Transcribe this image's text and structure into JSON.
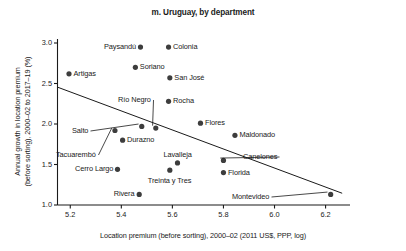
{
  "chart_data": {
    "type": "scatter",
    "title": "m. Uruguay, by department",
    "xlabel": "Location premium (before sorting), 2000–02 (2011 US$, PPP, log)",
    "ylabel_line1": "Annual growth in location premium",
    "ylabel_line2": "(before sorting), 2000–02 to 2017–19 (%)",
    "xlim": [
      5.15,
      6.28
    ],
    "ylim": [
      1.0,
      3.0
    ],
    "xticks": [
      "5.2",
      "5.4",
      "5.6",
      "5.8",
      "6.0",
      "6.2"
    ],
    "xtick_values": [
      5.2,
      5.4,
      5.6,
      5.8,
      6.0,
      6.2
    ],
    "yticks": [
      "1.0",
      "1.5",
      "2.0",
      "2.5",
      "3.0"
    ],
    "ytick_values": [
      1.0,
      1.5,
      2.0,
      2.5,
      3.0
    ],
    "grid": false,
    "legend": "none",
    "points": [
      {
        "name": "Paysandú",
        "x": 5.475,
        "y": 2.95,
        "label_side": "left"
      },
      {
        "name": "Colonia",
        "x": 5.585,
        "y": 2.95,
        "label_side": "right"
      },
      {
        "name": "Soriano",
        "x": 5.455,
        "y": 2.7,
        "label_side": "right"
      },
      {
        "name": "Artigas",
        "x": 5.195,
        "y": 2.62,
        "label_side": "right"
      },
      {
        "name": "San José",
        "x": 5.59,
        "y": 2.57,
        "label_side": "right"
      },
      {
        "name": "Rocha",
        "x": 5.585,
        "y": 2.28,
        "label_side": "right"
      },
      {
        "name": "Río Negro",
        "x": 5.535,
        "y": 1.95,
        "label_side": "leader"
      },
      {
        "name": "Flores",
        "x": 5.71,
        "y": 2.01,
        "label_side": "right"
      },
      {
        "name": "Salto",
        "x": 5.48,
        "y": 1.97,
        "label_side": "leader"
      },
      {
        "name": "Tacuarembó",
        "x": 5.375,
        "y": 1.92,
        "label_side": "leader"
      },
      {
        "name": "Maldonado",
        "x": 5.845,
        "y": 1.86,
        "label_side": "right"
      },
      {
        "name": "Durazno",
        "x": 5.405,
        "y": 1.8,
        "label_side": "right"
      },
      {
        "name": "Canelones",
        "x": 5.8,
        "y": 1.55,
        "label_side": "leader"
      },
      {
        "name": "Lavalleja",
        "x": 5.62,
        "y": 1.52,
        "label_side": "above"
      },
      {
        "name": "Cerro Largo",
        "x": 5.385,
        "y": 1.44,
        "label_side": "left"
      },
      {
        "name": "Treinta y Tres",
        "x": 5.59,
        "y": 1.43,
        "label_side": "below"
      },
      {
        "name": "Florida",
        "x": 5.8,
        "y": 1.4,
        "label_side": "right"
      },
      {
        "name": "Rivera",
        "x": 5.47,
        "y": 1.13,
        "label_side": "left"
      },
      {
        "name": "Montevideo",
        "x": 6.22,
        "y": 1.13,
        "label_side": "leader"
      }
    ],
    "trendline": {
      "x0": 5.15,
      "y0": 2.455,
      "x1": 6.265,
      "y1": 1.145
    },
    "marker_color": "#3d3d3d",
    "axis_color": "#1a1a1a",
    "trendline_color": "#1a1a1a"
  }
}
